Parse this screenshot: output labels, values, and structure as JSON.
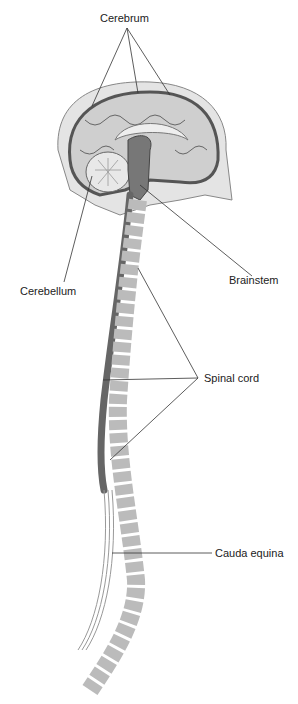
{
  "figure": {
    "type": "anatomical-illustration",
    "labels": [
      {
        "id": "cerebrum",
        "text": "Cerebrum"
      },
      {
        "id": "cerebellum",
        "text": "Cerebellum"
      },
      {
        "id": "brainstem",
        "text": "Brainstem"
      },
      {
        "id": "spinal-cord",
        "text": "Spinal cord"
      },
      {
        "id": "cauda-equina",
        "text": "Cauda equina"
      }
    ],
    "colors": {
      "tissue_dark": "#5a5a5a",
      "tissue_mid": "#9a9a9a",
      "tissue_light": "#d4d4d4",
      "bone": "#c8c8c8",
      "line": "#333333"
    }
  }
}
